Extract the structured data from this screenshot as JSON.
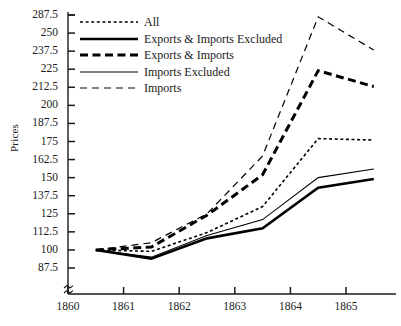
{
  "chart_data": {
    "type": "line",
    "title": "",
    "xlabel": "",
    "ylabel": "Prices",
    "x_tick_labels": [
      "1860",
      "1861",
      "1862",
      "1863",
      "1864",
      "1865"
    ],
    "x_tick_values": [
      1860,
      1861,
      1862,
      1863,
      1864,
      1865
    ],
    "y_tick_labels": [
      "287.5",
      "250",
      "237.5",
      "225",
      "212.5",
      "200",
      "187.5",
      "175",
      "162.5",
      "150",
      "137.5",
      "125",
      "112.5",
      "100",
      "87.5"
    ],
    "y_tick_values": [
      287.5,
      262.5,
      237.5,
      225,
      212.5,
      200,
      187.5,
      175,
      162.5,
      150,
      137.5,
      125,
      112.5,
      100,
      87.5
    ],
    "ylim": [
      87.5,
      287.5
    ],
    "xlim": [
      1860,
      1866
    ],
    "grid": false,
    "axis_break_y": true,
    "legend_position": "top-left",
    "x": [
      1860.5,
      1861.5,
      1862.5,
      1863.5,
      1864.5,
      1865.5
    ],
    "series": [
      {
        "name": "All",
        "style": "dotted",
        "width": 1.6,
        "color": "#000000",
        "values": [
          100,
          99,
          112,
          130,
          177,
          176
        ]
      },
      {
        "name": "Exports & Imports Excluded",
        "style": "solid",
        "width": 2.6,
        "color": "#000000",
        "values": [
          100,
          94,
          108,
          115,
          143,
          149
        ]
      },
      {
        "name": "Exports & Imports",
        "style": "dashed-bold",
        "width": 3.0,
        "color": "#000000",
        "values": [
          100,
          102,
          124,
          152,
          224,
          213
        ]
      },
      {
        "name": "Imports Excluded",
        "style": "solid-thin",
        "width": 1.1,
        "color": "#000000",
        "values": [
          100,
          95,
          110,
          121,
          150,
          156
        ]
      },
      {
        "name": "Imports",
        "style": "long-dash",
        "width": 1.2,
        "color": "#000000",
        "values": [
          100,
          105,
          125,
          165,
          285,
          239
        ]
      }
    ]
  },
  "legend": {
    "entries": [
      {
        "label": "All"
      },
      {
        "label": "Exports & Imports Excluded"
      },
      {
        "label": "Exports & Imports"
      },
      {
        "label": "Imports Excluded"
      },
      {
        "label": "Imports"
      }
    ]
  },
  "axes": {
    "y_title": "Prices"
  }
}
